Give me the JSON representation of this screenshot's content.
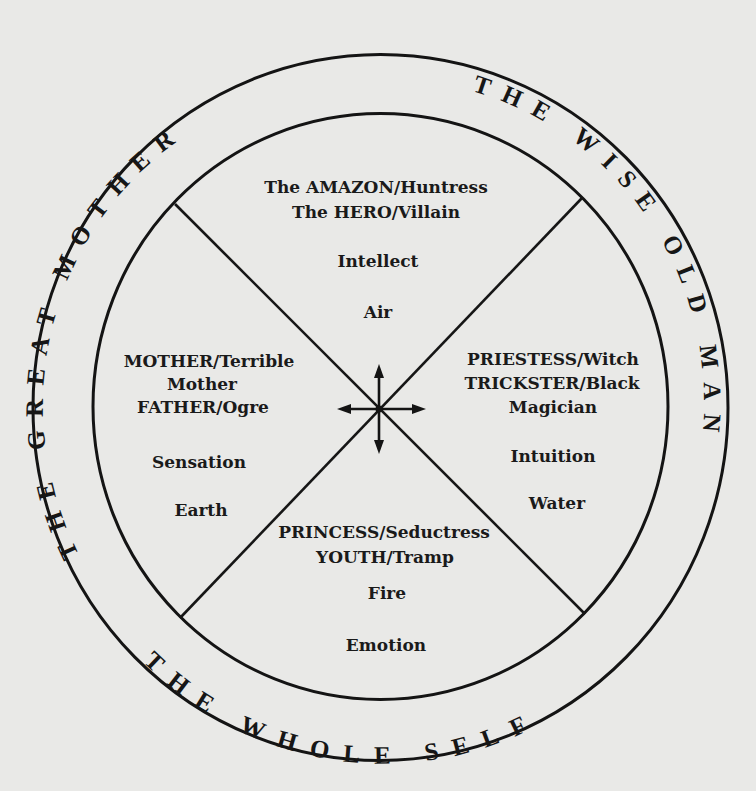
{
  "diagram": {
    "outer_ring_labels": {
      "left": "THE GREAT MOTHER",
      "right": "THE WISE OLD MAN",
      "bottom": "THE WHOLE SELF"
    },
    "quadrants": {
      "top": {
        "archetypes": [
          "The AMAZON/Huntress",
          "The HERO/Villain"
        ],
        "function": "Intellect",
        "element": "Air"
      },
      "left": {
        "archetypes": [
          "MOTHER/Terrible",
          "Mother",
          "FATHER/Ogre"
        ],
        "function": "Sensation",
        "element": "Earth"
      },
      "right": {
        "archetypes": [
          "PRIESTESS/Witch",
          "TRICKSTER/Black",
          "Magician"
        ],
        "function": "Intuition",
        "element": "Water"
      },
      "bottom": {
        "archetypes": [
          "PRINCESS/Seductress",
          "YOUTH/Tramp"
        ],
        "element": "Fire",
        "function": "Emotion"
      }
    },
    "center_symbol": "four-way-arrows-icon",
    "colors": {
      "background": "#e9e9e7",
      "ink": "#141414"
    }
  }
}
